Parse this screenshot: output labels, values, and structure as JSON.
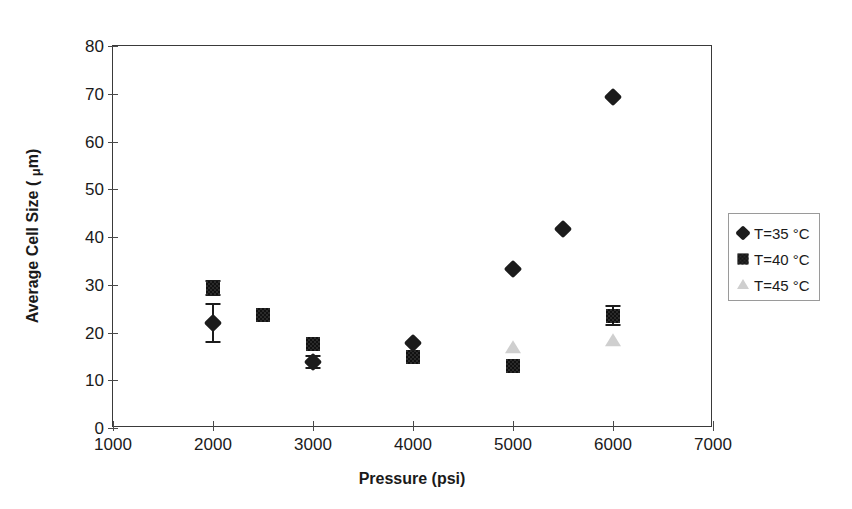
{
  "chart_data": {
    "type": "scatter",
    "title": "",
    "xlabel": "Pressure (psi)",
    "ylabel": "Average Cell Size ( μm)",
    "ylabel_prefix": "Average Cell Size ( ",
    "ylabel_mu": "μ",
    "ylabel_suffix": "m)",
    "xlim": [
      1000,
      7000
    ],
    "ylim": [
      0,
      80
    ],
    "xticks": [
      1000,
      2000,
      3000,
      4000,
      5000,
      6000,
      7000
    ],
    "yticks": [
      0,
      10,
      20,
      30,
      40,
      50,
      60,
      70,
      80
    ],
    "xtick_labels": [
      "1000",
      "2000",
      "3000",
      "4000",
      "5000",
      "6000",
      "7000"
    ],
    "ytick_labels": [
      "0",
      "10",
      "20",
      "30",
      "40",
      "50",
      "60",
      "70",
      "80"
    ],
    "grid": false,
    "legend_position": "right-outside",
    "series": [
      {
        "name": "T=35 °C",
        "marker": "diamond",
        "color": "#1c1c1c",
        "points": [
          {
            "x": 2000,
            "y": 22.0,
            "yerr": 4.0
          },
          {
            "x": 3000,
            "y": 13.8,
            "yerr": 1.2
          },
          {
            "x": 4000,
            "y": 17.8,
            "yerr": 0
          },
          {
            "x": 5000,
            "y": 33.3,
            "yerr": 0
          },
          {
            "x": 5500,
            "y": 41.7,
            "yerr": 0
          },
          {
            "x": 6000,
            "y": 69.4,
            "yerr": 0
          }
        ]
      },
      {
        "name": "T=40 °C",
        "marker": "square",
        "color": "#2a2a2a",
        "points": [
          {
            "x": 2000,
            "y": 29.3,
            "yerr": 1.5
          },
          {
            "x": 2500,
            "y": 23.6,
            "yerr": 0
          },
          {
            "x": 3000,
            "y": 17.5,
            "yerr": 0
          },
          {
            "x": 4000,
            "y": 14.8,
            "yerr": 0
          },
          {
            "x": 5000,
            "y": 13.0,
            "yerr": 0
          },
          {
            "x": 6000,
            "y": 23.5,
            "yerr": 2.0
          }
        ]
      },
      {
        "name": "T=45 °C",
        "marker": "triangle",
        "color": "#cfcfcf",
        "points": [
          {
            "x": 5000,
            "y": 16.8,
            "yerr": 0
          },
          {
            "x": 6000,
            "y": 18.3,
            "yerr": 0
          }
        ]
      }
    ]
  },
  "legend": {
    "items": [
      {
        "label": "T=35 °C",
        "marker": "diamond"
      },
      {
        "label": "T=40 °C",
        "marker": "square"
      },
      {
        "label": "T=45 °C",
        "marker": "triangle"
      }
    ]
  }
}
